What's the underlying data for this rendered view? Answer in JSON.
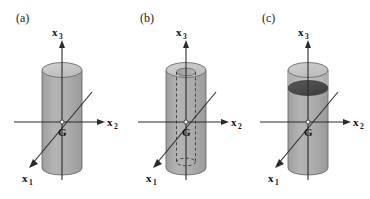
{
  "figure": {
    "background_color": "#ffffff",
    "panel_count": 3
  },
  "style": {
    "cylinder_body_color": "#a9a9a9",
    "cylinder_body_color_light": "#bdbdbd",
    "cylinder_top_color": "#c9c9c9",
    "cylinder_bore_color": "#b5b5b5",
    "fill_level_color": "#4a4a4a",
    "outline_color": "#6b6b6b",
    "axis_color": "#2b2b2b",
    "text_color": "#101010"
  },
  "axes": {
    "vertical_label": "x",
    "vertical_sub": "3",
    "horizontal_label": "x",
    "horizontal_sub": "2",
    "diagonal_label": "x",
    "diagonal_sub": "1",
    "origin_label": "G"
  },
  "panels": [
    {
      "id": "a",
      "label": "(a)",
      "description": "solid cylinder",
      "has_bore": false,
      "has_fill_level": false
    },
    {
      "id": "b",
      "label": "(b)",
      "description": "hollow cylinder with dashed inner bore",
      "has_bore": true,
      "has_fill_level": false
    },
    {
      "id": "c",
      "label": "(c)",
      "description": "cylinder with dark filled level near top",
      "has_bore": false,
      "has_fill_level": true
    }
  ]
}
